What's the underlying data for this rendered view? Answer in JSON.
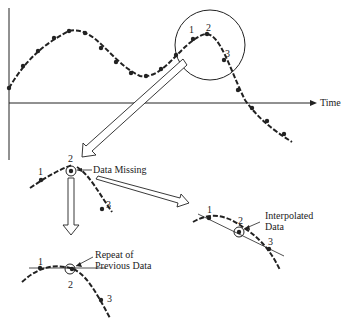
{
  "diagram": {
    "axis_label": "Time",
    "point_labels": [
      "1",
      "2",
      "3"
    ],
    "annotations": {
      "missing": "Data Missing",
      "interpolated_line1": "Interpolated",
      "interpolated_line2": "Data",
      "repeat_line1": "Repeat of",
      "repeat_line2": "Previous Data"
    },
    "ink_color": "#222222"
  }
}
